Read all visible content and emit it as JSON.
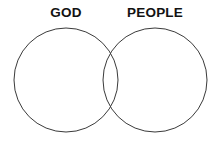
{
  "canvas": {
    "width": 220,
    "height": 142,
    "background_color": "#ffffff"
  },
  "diagram": {
    "type": "venn-diagram",
    "set_count": 2,
    "stroke_color": "#3a3a3a",
    "stroke_width": 1,
    "fill": "none",
    "labels": {
      "left": "GOD",
      "right": "PEOPLE"
    },
    "circles": [
      {
        "name": "god-circle",
        "cx": 66,
        "cy": 80,
        "r": 52
      },
      {
        "name": "people-circle",
        "cx": 155,
        "cy": 80,
        "r": 52
      }
    ],
    "intersection": {
      "top_point": {
        "x": 109,
        "y": 42
      },
      "bottom_point": {
        "x": 109,
        "y": 118
      }
    }
  }
}
